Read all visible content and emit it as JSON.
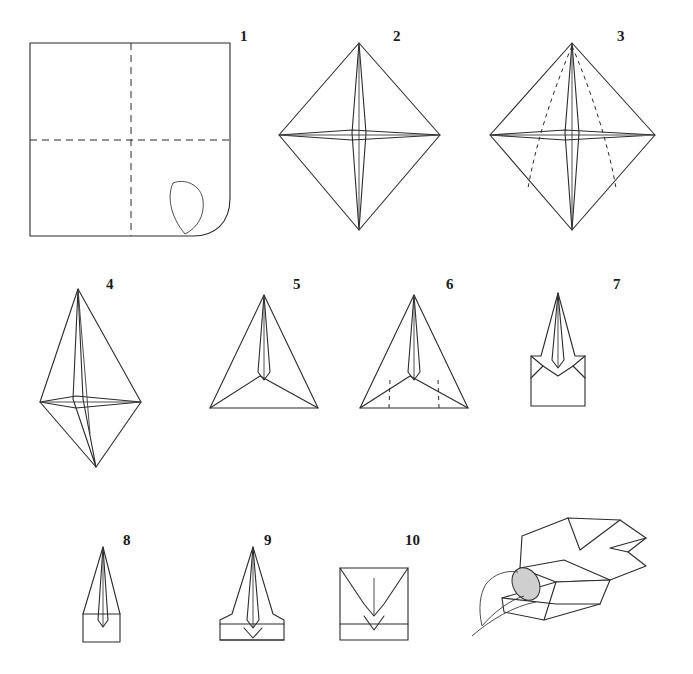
{
  "diagram": {
    "background_color": "#ffffff",
    "line_color": "#2b2b2b",
    "steps": [
      {
        "number": "1",
        "label": "square sheet with creases and corner curl"
      },
      {
        "number": "2",
        "label": "preliminary diamond base"
      },
      {
        "number": "3",
        "label": "diamond with dashed fold guides"
      },
      {
        "number": "4",
        "label": "kite shape folded"
      },
      {
        "number": "5",
        "label": "triangle with inner fold"
      },
      {
        "number": "6",
        "label": "triangle with dashed side folds"
      },
      {
        "number": "7",
        "label": "sides folded inward"
      },
      {
        "number": "8",
        "label": "narrow folded form"
      },
      {
        "number": "9",
        "label": "folded form with bottom band"
      },
      {
        "number": "10",
        "label": "final flattened form"
      }
    ],
    "final_panel": {
      "label": "hand holding finished model"
    }
  }
}
